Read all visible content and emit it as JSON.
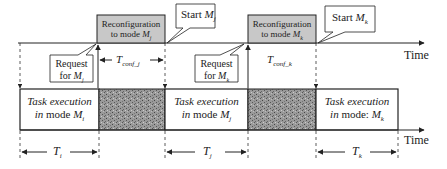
{
  "diagram": {
    "type": "timing-diagram",
    "axis_label_top": "Time",
    "axis_label_bottom": "Time",
    "reconfig_boxes": [
      {
        "line1": "Reconfiguration",
        "line2_prefix": "to mode ",
        "mode": "M",
        "sub": "j"
      },
      {
        "line1": "Reconfiguration",
        "line2_prefix": "to mode ",
        "mode": "M",
        "sub": "k"
      }
    ],
    "start_callouts": [
      {
        "prefix": "Start ",
        "mode": "M",
        "sub": "j"
      },
      {
        "prefix": "Start ",
        "mode": "M",
        "sub": "k"
      }
    ],
    "request_callouts": [
      {
        "line1": "Request",
        "line2_prefix": "for ",
        "mode": "M",
        "sub": "j"
      },
      {
        "line1": "Request",
        "line2_prefix": "for ",
        "mode": "M",
        "sub": "k"
      }
    ],
    "conf_times": [
      {
        "symbol": "T",
        "sub": "conf_j"
      },
      {
        "symbol": "T",
        "sub": "conf_k"
      }
    ],
    "task_boxes": [
      {
        "line1": "Task execution",
        "line2_italic": "in",
        "line2_rest": " mode ",
        "mode": "M",
        "sub": "i"
      },
      {
        "line1": "Task execution",
        "line2_italic": "in",
        "line2_rest": " mode ",
        "mode": "M",
        "sub": "j"
      },
      {
        "line1": "Task execution",
        "line2_italic": "in",
        "line2_rest": " mode: ",
        "mode": "M",
        "sub": "k"
      }
    ],
    "durations": [
      {
        "symbol": "T",
        "sub": "i"
      },
      {
        "symbol": "T",
        "sub": "j"
      },
      {
        "symbol": "T",
        "sub": "k"
      }
    ],
    "colors": {
      "reconfig_fill": "#c8c8c8",
      "noise_fill": "#8a8a8a",
      "line": "#222222"
    }
  }
}
